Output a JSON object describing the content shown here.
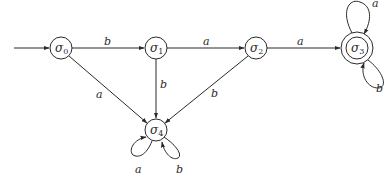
{
  "diagram": {
    "type": "finite-state-automaton",
    "start_state": "σ0",
    "accepting_states": [
      "σ3"
    ],
    "states": [
      {
        "id": "s0",
        "label": "σ",
        "sub": "0",
        "x": 61,
        "y": 48,
        "accepting": false
      },
      {
        "id": "s1",
        "label": "σ",
        "sub": "1",
        "x": 156,
        "y": 48,
        "accepting": false
      },
      {
        "id": "s2",
        "label": "σ",
        "sub": "2",
        "x": 256,
        "y": 48,
        "accepting": false
      },
      {
        "id": "s3",
        "label": "σ",
        "sub": "3",
        "x": 357,
        "y": 48,
        "accepting": true
      },
      {
        "id": "s4",
        "label": "σ",
        "sub": "4",
        "x": 156,
        "y": 130,
        "accepting": false
      }
    ],
    "transitions": [
      {
        "from": "σ0",
        "to": "σ1",
        "symbol": "b"
      },
      {
        "from": "σ0",
        "to": "σ4",
        "symbol": "a"
      },
      {
        "from": "σ1",
        "to": "σ2",
        "symbol": "a"
      },
      {
        "from": "σ1",
        "to": "σ4",
        "symbol": "b"
      },
      {
        "from": "σ2",
        "to": "σ3",
        "symbol": "a"
      },
      {
        "from": "σ2",
        "to": "σ4",
        "symbol": "b"
      },
      {
        "from": "σ3",
        "to": "σ3",
        "symbol": "a"
      },
      {
        "from": "σ3",
        "to": "σ3",
        "symbol": "b"
      },
      {
        "from": "σ4",
        "to": "σ4",
        "symbol": "a"
      },
      {
        "from": "σ4",
        "to": "σ4",
        "symbol": "b"
      }
    ],
    "labels": {
      "s0_s1": "b",
      "s0_s4": "a",
      "s1_s2": "a",
      "s1_s4": "b",
      "s2_s3": "a",
      "s2_s4": "b",
      "s3_loop_top": "a",
      "s3_loop_bottom": "b",
      "s4_loop_left": "a",
      "s4_loop_right": "b"
    },
    "colors": {
      "stroke": "#2a2a2a",
      "background": "#ffffff"
    }
  }
}
